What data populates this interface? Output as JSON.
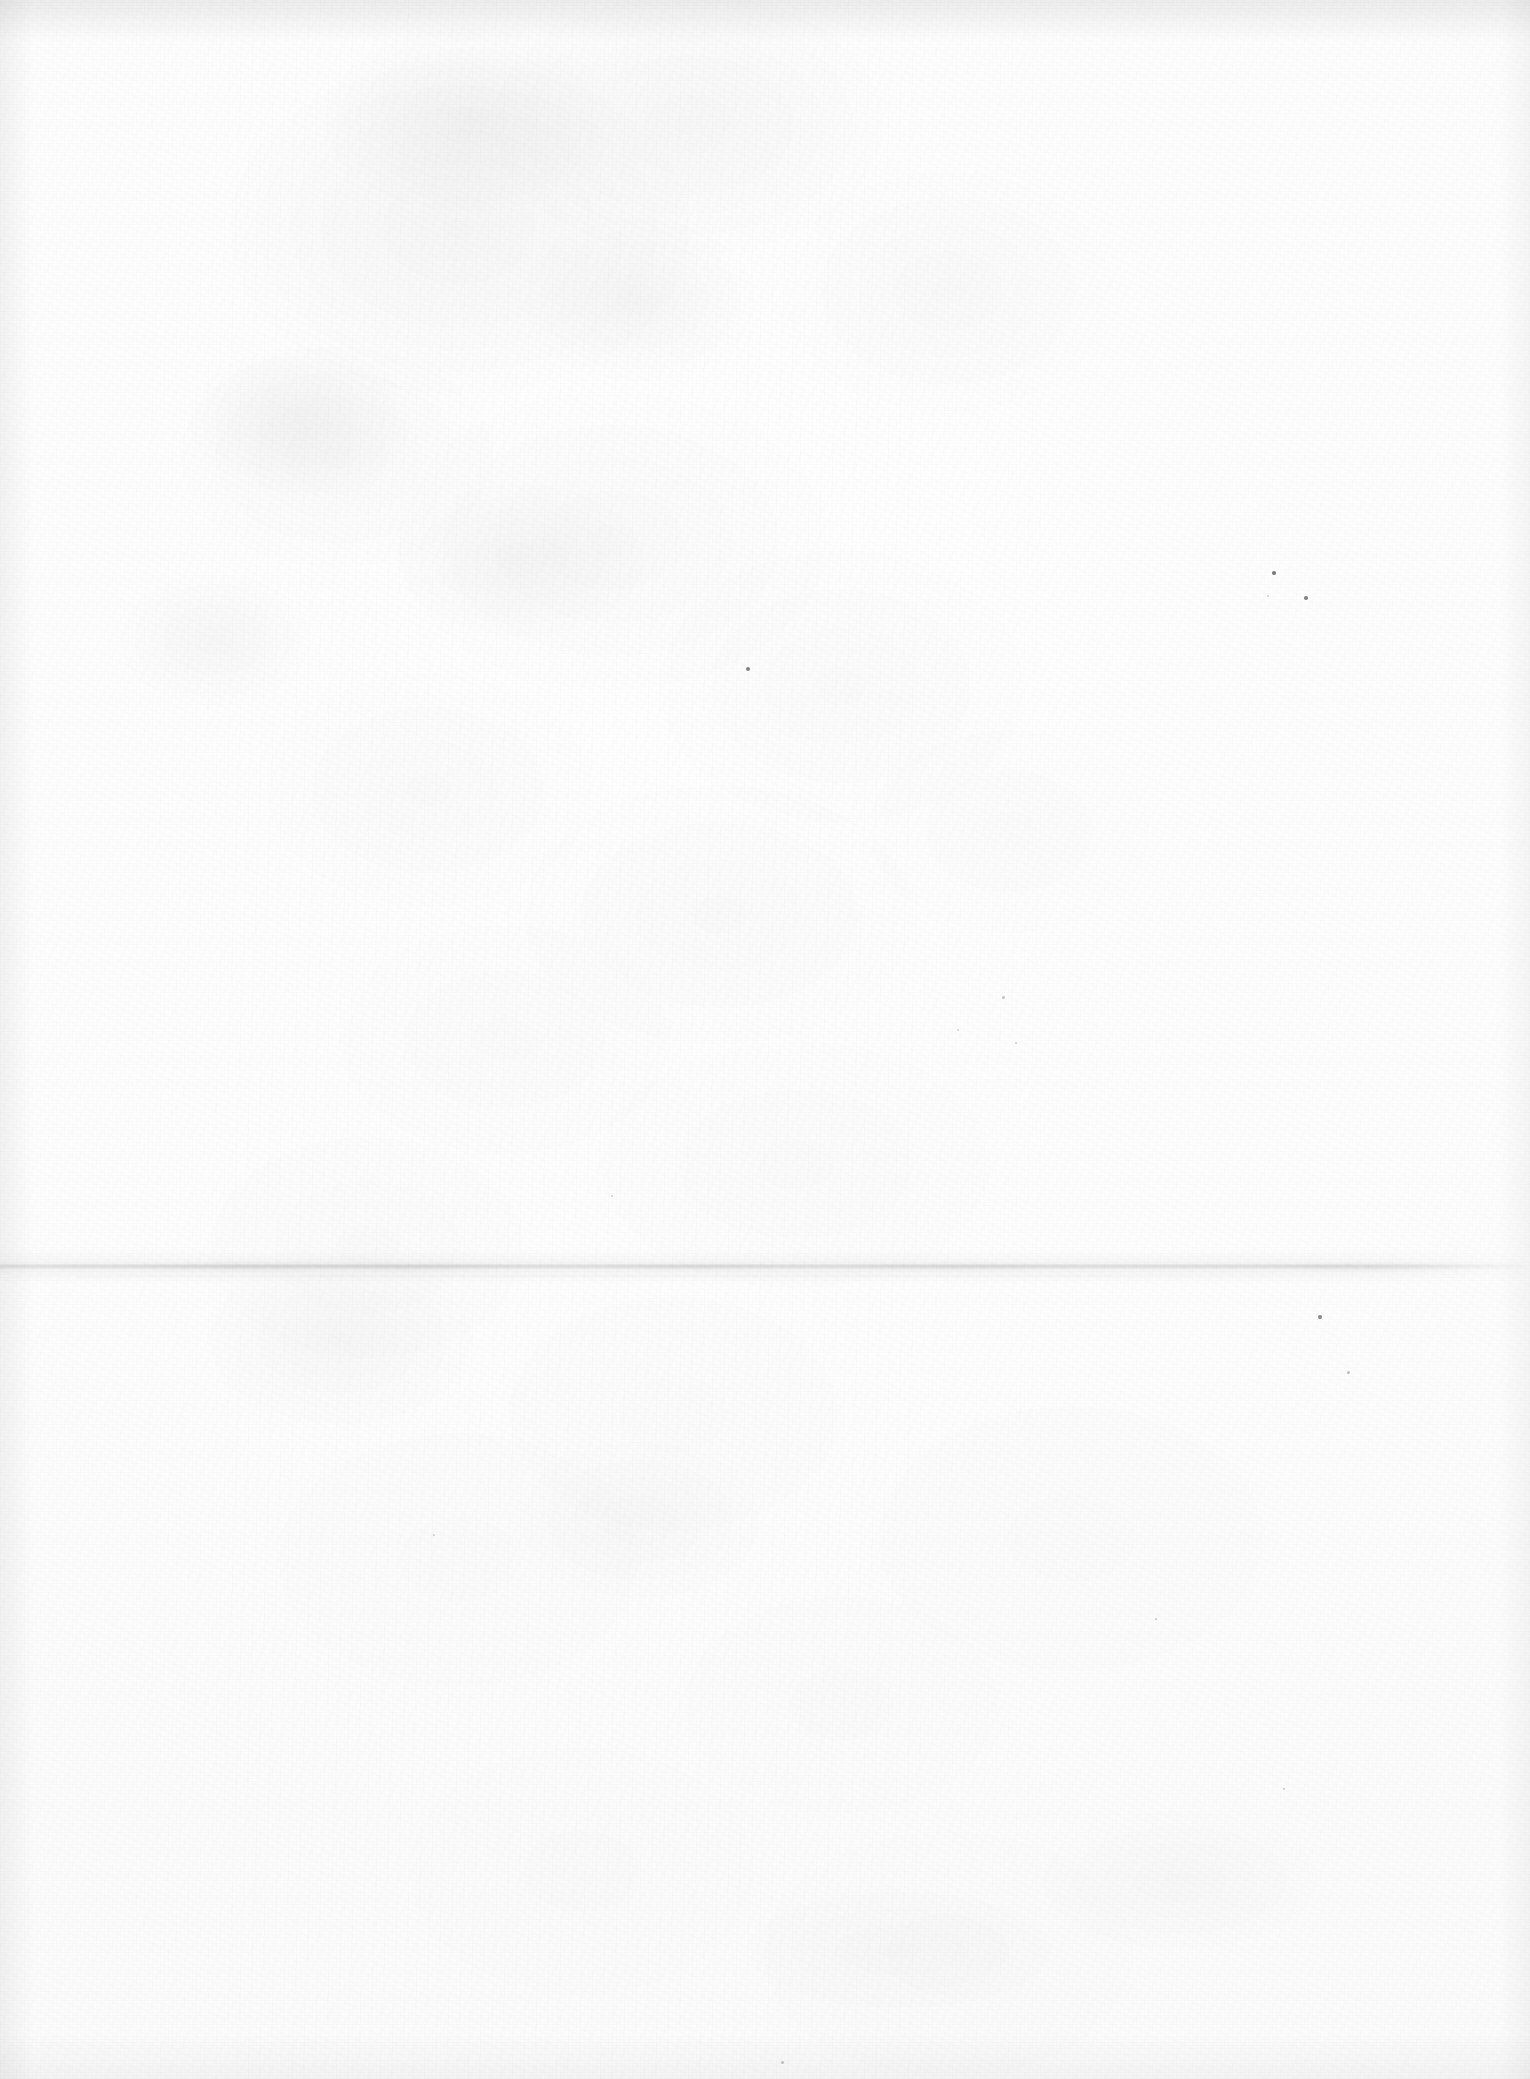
{
  "document": {
    "kind": "scanned-blank-sheet",
    "page_label": "",
    "visible_text": "",
    "note": ""
  },
  "canvas": {
    "width": 1530,
    "height": 2079,
    "paper_color": "#fdfdfd",
    "base_white": "#ffffff"
  },
  "features": {
    "fold_crease": {
      "orientation": "horizontal",
      "y": 1268,
      "x_start": 0,
      "x_end": 1512,
      "color": "#d9d9d9",
      "thickness": 5
    },
    "edge_shadows": {
      "top_color": "#eeeeee",
      "left_color": "#f1f1f1",
      "right_color": "#f5f5f5",
      "bottom_color": "#f4f4f4"
    },
    "grain_color": "#f7f7f7",
    "mottle_color": "#f2f2f2"
  },
  "specks": [
    {
      "x": 748,
      "y": 669,
      "size": 4,
      "color": "#6e6e72"
    },
    {
      "x": 1274,
      "y": 573,
      "size": 4,
      "color": "#5f5f66"
    },
    {
      "x": 1306,
      "y": 598,
      "size": 4,
      "color": "#6a6a70"
    },
    {
      "x": 1268,
      "y": 596,
      "size": 2,
      "color": "#9a9aa0"
    },
    {
      "x": 1320,
      "y": 1317,
      "size": 4,
      "color": "#72727a"
    },
    {
      "x": 1348,
      "y": 1372,
      "size": 3,
      "color": "#7c7c84"
    },
    {
      "x": 1003,
      "y": 997,
      "size": 3,
      "color": "#86868c"
    },
    {
      "x": 1016,
      "y": 1043,
      "size": 2,
      "color": "#9b9ba2"
    },
    {
      "x": 958,
      "y": 1030,
      "size": 2,
      "color": "#a2a2a8"
    },
    {
      "x": 1156,
      "y": 1619,
      "size": 2,
      "color": "#9d9da4"
    },
    {
      "x": 1284,
      "y": 1789,
      "size": 2,
      "color": "#a0a0a6"
    },
    {
      "x": 782,
      "y": 2062,
      "size": 3,
      "color": "#8a8a90"
    },
    {
      "x": 434,
      "y": 1535,
      "size": 2,
      "color": "#a6a6ac"
    },
    {
      "x": 612,
      "y": 1196,
      "size": 2,
      "color": "#a4a4aa"
    }
  ],
  "smudges": [
    {
      "x": 300,
      "y": 420,
      "w": 230,
      "h": 150,
      "opacity": 0.035
    },
    {
      "x": 470,
      "y": 120,
      "w": 300,
      "h": 190,
      "opacity": 0.04
    },
    {
      "x": 215,
      "y": 640,
      "w": 200,
      "h": 140,
      "opacity": 0.028
    },
    {
      "x": 520,
      "y": 560,
      "w": 260,
      "h": 160,
      "opacity": 0.026
    },
    {
      "x": 640,
      "y": 300,
      "w": 240,
      "h": 170,
      "opacity": 0.03
    },
    {
      "x": 340,
      "y": 1340,
      "w": 280,
      "h": 180,
      "opacity": 0.024
    },
    {
      "x": 640,
      "y": 1520,
      "w": 260,
      "h": 170,
      "opacity": 0.018
    },
    {
      "x": 1180,
      "y": 1880,
      "w": 300,
      "h": 150,
      "opacity": 0.02
    },
    {
      "x": 900,
      "y": 1950,
      "w": 340,
      "h": 130,
      "opacity": 0.016
    }
  ]
}
